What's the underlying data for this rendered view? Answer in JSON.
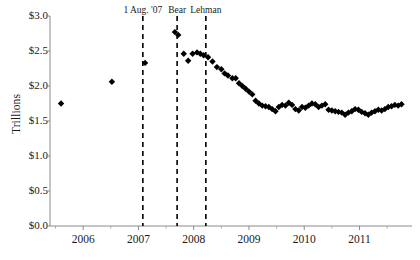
{
  "chart_data": {
    "type": "scatter",
    "title": "",
    "xlabel": "",
    "ylabel": "Trillions",
    "xlim": [
      2005.4,
      2011.95
    ],
    "ylim": [
      0.0,
      3.0
    ],
    "grid": false,
    "legend": null,
    "y_tick_values": [
      0.0,
      0.5,
      1.0,
      1.5,
      2.0,
      2.5,
      3.0
    ],
    "y_tick_labels": [
      "$0.0",
      "$0.5",
      "$1.0",
      "$1.5",
      "$2.0",
      "$2.5",
      "$3.0"
    ],
    "x_tick_values": [
      2006,
      2007,
      2008,
      2009,
      2010,
      2011
    ],
    "x_tick_labels": [
      "2006",
      "2007",
      "2008",
      "2009",
      "2010",
      "2011"
    ],
    "x_minor_tick_values": [
      2005.5,
      2006.5,
      2007.5,
      2008.5,
      2009.5,
      2010.5,
      2011.5
    ],
    "marker": "diamond",
    "marker_color": "#000000",
    "marker_size": 3.2,
    "annotations": [
      {
        "label": "1 Aug. '07",
        "x": 2007.08,
        "style": "dashed-vline",
        "color": "#000000"
      },
      {
        "label": "Bear",
        "x": 2007.7,
        "style": "dashed-vline",
        "color": "#000000"
      },
      {
        "label": "Lehman",
        "x": 2008.22,
        "style": "dashed-vline",
        "color": "#000000"
      }
    ],
    "series": [
      {
        "name": "Outstanding",
        "x": [
          2005.6,
          2006.52,
          2007.12,
          2007.66,
          2007.72,
          2007.82,
          2007.9,
          2007.98,
          2008.06,
          2008.12,
          2008.18,
          2008.26,
          2008.34,
          2008.42,
          2008.5,
          2008.56,
          2008.62,
          2008.7,
          2008.76,
          2008.82,
          2008.88,
          2008.94,
          2009.0,
          2009.06,
          2009.12,
          2009.18,
          2009.24,
          2009.3,
          2009.36,
          2009.42,
          2009.48,
          2009.54,
          2009.6,
          2009.66,
          2009.72,
          2009.78,
          2009.84,
          2009.9,
          2009.96,
          2010.02,
          2010.08,
          2010.14,
          2010.2,
          2010.26,
          2010.32,
          2010.38,
          2010.44,
          2010.5,
          2010.56,
          2010.62,
          2010.68,
          2010.74,
          2010.8,
          2010.86,
          2010.92,
          2010.98,
          2011.04,
          2011.1,
          2011.16,
          2011.22,
          2011.28,
          2011.34,
          2011.4,
          2011.46,
          2011.52,
          2011.58,
          2011.64,
          2011.7,
          2011.76
        ],
        "y": [
          1.75,
          2.06,
          2.33,
          2.77,
          2.73,
          2.46,
          2.36,
          2.46,
          2.48,
          2.46,
          2.44,
          2.41,
          2.35,
          2.27,
          2.24,
          2.18,
          2.15,
          2.11,
          2.11,
          2.04,
          2.0,
          1.96,
          1.92,
          1.88,
          1.79,
          1.75,
          1.72,
          1.71,
          1.7,
          1.67,
          1.64,
          1.7,
          1.73,
          1.72,
          1.76,
          1.73,
          1.67,
          1.65,
          1.7,
          1.69,
          1.72,
          1.75,
          1.74,
          1.7,
          1.72,
          1.74,
          1.66,
          1.65,
          1.64,
          1.63,
          1.62,
          1.59,
          1.62,
          1.64,
          1.67,
          1.66,
          1.63,
          1.61,
          1.59,
          1.62,
          1.64,
          1.66,
          1.65,
          1.67,
          1.7,
          1.71,
          1.73,
          1.72,
          1.74
        ]
      }
    ]
  }
}
